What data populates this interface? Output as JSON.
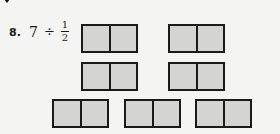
{
  "problem": {
    "number": "8.",
    "dividend": "7",
    "operator": "÷",
    "divisor": {
      "numerator": "1",
      "denominator": "2"
    }
  },
  "diagram": {
    "wholes": 7,
    "parts_per_whole": 2,
    "fill_color": "#d4d4d2",
    "border_color": "#1a1a1a",
    "boxes": [
      {
        "x": 81,
        "y": 24
      },
      {
        "x": 168,
        "y": 24
      },
      {
        "x": 81,
        "y": 62
      },
      {
        "x": 168,
        "y": 62
      },
      {
        "x": 52,
        "y": 99
      },
      {
        "x": 124,
        "y": 99
      },
      {
        "x": 195,
        "y": 99
      }
    ]
  }
}
